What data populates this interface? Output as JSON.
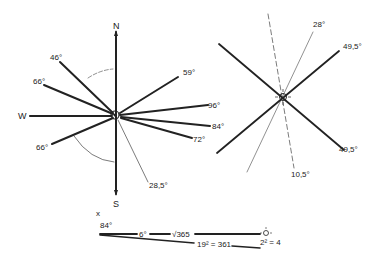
{
  "left_rose": {
    "cardinals": {
      "north": "N",
      "south": "S",
      "west": "W"
    },
    "angle_labels": {
      "a46": "46°",
      "a66_upper": "66°",
      "a66_lower": "66°",
      "a59": "59°",
      "a96": "96°",
      "a84": "84°",
      "a72": "72°",
      "a28_5": "28,5°"
    },
    "center_symbol": "moon-sun-icon"
  },
  "right_rose": {
    "angle_labels": {
      "a28": "28°",
      "a49_5_upper": "49,5°",
      "a49_5_lower": "49,5°",
      "a10_5": "10,5°"
    },
    "center_symbol": "sun-icon"
  },
  "bottom_formula": {
    "angle_small": "84°",
    "angle_6": "6°",
    "sqrt_label": "√365",
    "square_label": "19² = 361",
    "right_label": "2² = 4",
    "small_mark": "x"
  },
  "colors": {
    "ink": "#222222",
    "background": "#ffffff"
  }
}
